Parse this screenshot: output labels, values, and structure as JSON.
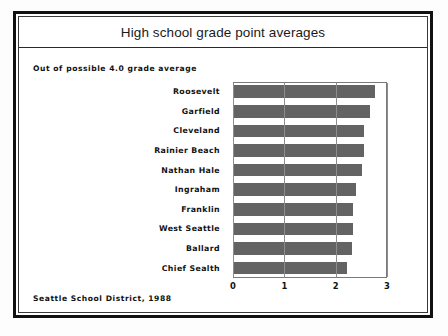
{
  "chart_title": "High school grade point averages",
  "subtitle": "Out of possible 4.0 grade average",
  "footer": "Seattle School District, 1988",
  "axis": {
    "ticks": [
      "0",
      "1",
      "2",
      "3"
    ]
  },
  "chart_data": {
    "type": "bar",
    "orientation": "horizontal",
    "title": "High school grade point averages",
    "subtitle": "Out of possible 4.0 grade average",
    "source": "Seattle School District, 1988",
    "xlabel": "",
    "ylabel": "",
    "xlim": [
      0,
      3
    ],
    "xticks": [
      0,
      1,
      2,
      3
    ],
    "grid": true,
    "legend": false,
    "bar_color": "#636363",
    "categories": [
      "Roosevelt",
      "Garfield",
      "Cleveland",
      "Rainier Beach",
      "Nathan Hale",
      "Ingraham",
      "Franklin",
      "West Seattle",
      "Ballard",
      "Chief Sealth"
    ],
    "values": [
      2.76,
      2.66,
      2.56,
      2.55,
      2.51,
      2.39,
      2.33,
      2.33,
      2.31,
      2.23
    ]
  }
}
